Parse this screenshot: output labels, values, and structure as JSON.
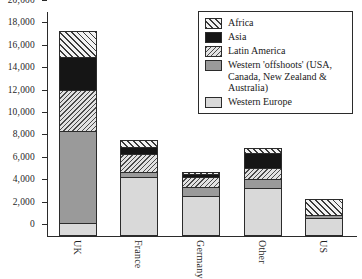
{
  "chart_data": {
    "type": "bar",
    "subtype": "stacked-bar",
    "title": "",
    "xlabel": "",
    "ylabel": "",
    "categories": [
      "UK",
      "France",
      "Germany",
      "Other",
      "US"
    ],
    "ylim": [
      0,
      20000
    ],
    "ytick_values": [
      0,
      2000,
      4000,
      6000,
      8000,
      10000,
      12000,
      14000,
      16000,
      18000,
      20000
    ],
    "ytick_labels": [
      "0",
      "2,000",
      "4,000",
      "6,000",
      "8,000",
      "10,000",
      "12,000",
      "14,000",
      "16,000",
      "18,000",
      "20,000"
    ],
    "grid": false,
    "legend_position": "top-right",
    "stack_order_bottom_to_top": [
      "Western Europe",
      "Western 'offshoots' (USA, Canada, New Zealand & Australia)",
      "Latin America",
      "Asia",
      "Africa"
    ],
    "series": [
      {
        "name": "Western Europe",
        "key": "westeurope",
        "legend_label": "Western Europe",
        "pattern": "solid-light-gray",
        "color": "#d9d9d9",
        "values": [
          1000,
          5200,
          3500,
          4200,
          1500
        ]
      },
      {
        "name": "Western 'offshoots' (USA, Canada, New Zealand & Australia)",
        "key": "offshoots",
        "legend_label": "Western 'offshoots' (USA, Canada, New Zealand & Australia)",
        "pattern": "solid-mid-gray",
        "color": "#9a9a9a",
        "values": [
          8300,
          500,
          800,
          800,
          300
        ]
      },
      {
        "name": "Latin America",
        "key": "latinamerica",
        "legend_label": "Latin America",
        "pattern": "dense-diagonal-hatch-backslash",
        "color": "#e2e2e2",
        "values": [
          3700,
          1600,
          1000,
          1000,
          0
        ]
      },
      {
        "name": "Asia",
        "key": "asia",
        "legend_label": "Asia",
        "pattern": "solid-black",
        "color": "#151515",
        "values": [
          3000,
          600,
          200,
          1400,
          0
        ]
      },
      {
        "name": "Africa",
        "key": "africa",
        "legend_label": "Africa",
        "pattern": "wide-diagonal-hatch-slash",
        "color": "#f2f2f2",
        "values": [
          2300,
          700,
          200,
          500,
          1500
        ]
      }
    ],
    "totals": [
      18300,
      8600,
      5700,
      7900,
      3300
    ]
  },
  "legend": {
    "items": [
      {
        "label": "Africa"
      },
      {
        "label": "Asia"
      },
      {
        "label": "Latin America"
      },
      {
        "label": "Western 'offshoots' (USA, Canada, New Zealand & Australia)"
      },
      {
        "label": "Western Europe"
      }
    ]
  }
}
